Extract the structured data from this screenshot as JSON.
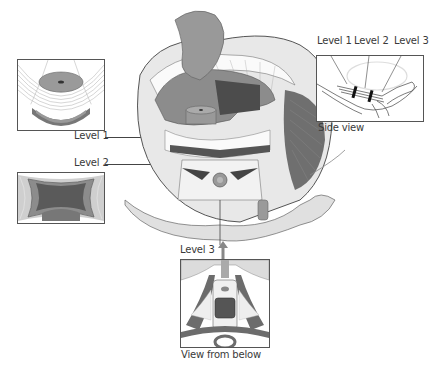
{
  "diagram": {
    "labels": {
      "level1": "Level 1",
      "level2": "Level 2",
      "level3": "Level 3"
    },
    "side_view": {
      "caption": "Side view",
      "labels": [
        "Level 1",
        "Level 2",
        "Level 3"
      ]
    },
    "bottom_view": {
      "caption": "View from below"
    },
    "insets": [
      {
        "name": "level-1-cross-section"
      },
      {
        "name": "level-2-cross-section"
      }
    ],
    "colors": {
      "dark_muscle": "#555555",
      "mid_gray": "#8a8a8a",
      "light_gray": "#c8c8c8",
      "paper": "#ffffff",
      "outline": "#444444"
    }
  }
}
